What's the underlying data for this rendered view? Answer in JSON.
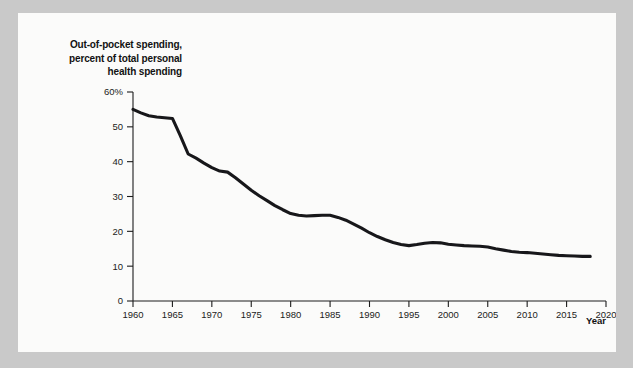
{
  "figure": {
    "y_axis_title": "Out-of-pocket spending, percent of total personal health spending",
    "y_axis_title_lines": [
      "Out-of-pocket spending,",
      "percent of total personal",
      "health spending"
    ],
    "x_axis_title": "Year",
    "background_color": "#c9c9c9",
    "card_color": "#fbfbfa",
    "line_color": "#17171a"
  },
  "chart_data": {
    "type": "line",
    "title": "",
    "subtitle": "",
    "xlabel": "Year",
    "ylabel": "Out-of-pocket spending, percent of total personal health spending",
    "xlim": [
      1960,
      2020
    ],
    "ylim": [
      0,
      60
    ],
    "grid": false,
    "legend": null,
    "xticks": [
      1960,
      1965,
      1970,
      1975,
      1980,
      1985,
      1990,
      1995,
      2000,
      2005,
      2010,
      2015,
      2020
    ],
    "xticklabels": [
      "1960",
      "1965",
      "1970",
      "1975",
      "1980",
      "1985",
      "1990",
      "1995",
      "2000",
      "2005",
      "2010",
      "2015",
      "2020"
    ],
    "yticks": [
      0,
      10,
      20,
      30,
      40,
      50,
      60
    ],
    "yticklabels": [
      "0",
      "10",
      "20",
      "30",
      "40",
      "50",
      "60%"
    ],
    "series": [
      {
        "name": "Out-of-pocket share of personal health spending",
        "x": [
          1960,
          1961,
          1962,
          1963,
          1964,
          1965,
          1966,
          1967,
          1968,
          1969,
          1970,
          1971,
          1972,
          1973,
          1974,
          1975,
          1976,
          1977,
          1978,
          1979,
          1980,
          1981,
          1982,
          1983,
          1984,
          1985,
          1986,
          1987,
          1988,
          1989,
          1990,
          1991,
          1992,
          1993,
          1994,
          1995,
          1996,
          1997,
          1998,
          1999,
          2000,
          2001,
          2002,
          2003,
          2004,
          2005,
          2006,
          2007,
          2008,
          2009,
          2010,
          2011,
          2012,
          2013,
          2014,
          2015,
          2016,
          2017,
          2018
        ],
        "y": [
          55.0,
          54.0,
          53.2,
          52.8,
          52.6,
          52.4,
          47.5,
          42.2,
          41.0,
          39.6,
          38.3,
          37.3,
          37.0,
          35.4,
          33.6,
          31.8,
          30.2,
          28.8,
          27.4,
          26.2,
          25.1,
          24.6,
          24.4,
          24.5,
          24.6,
          24.6,
          24.0,
          23.2,
          22.1,
          20.9,
          19.6,
          18.5,
          17.6,
          16.8,
          16.2,
          15.9,
          16.2,
          16.6,
          16.8,
          16.7,
          16.3,
          16.1,
          15.9,
          15.8,
          15.7,
          15.5,
          15.0,
          14.6,
          14.2,
          14.0,
          13.9,
          13.7,
          13.5,
          13.3,
          13.1,
          13.0,
          12.9,
          12.8,
          12.8
        ]
      }
    ]
  }
}
